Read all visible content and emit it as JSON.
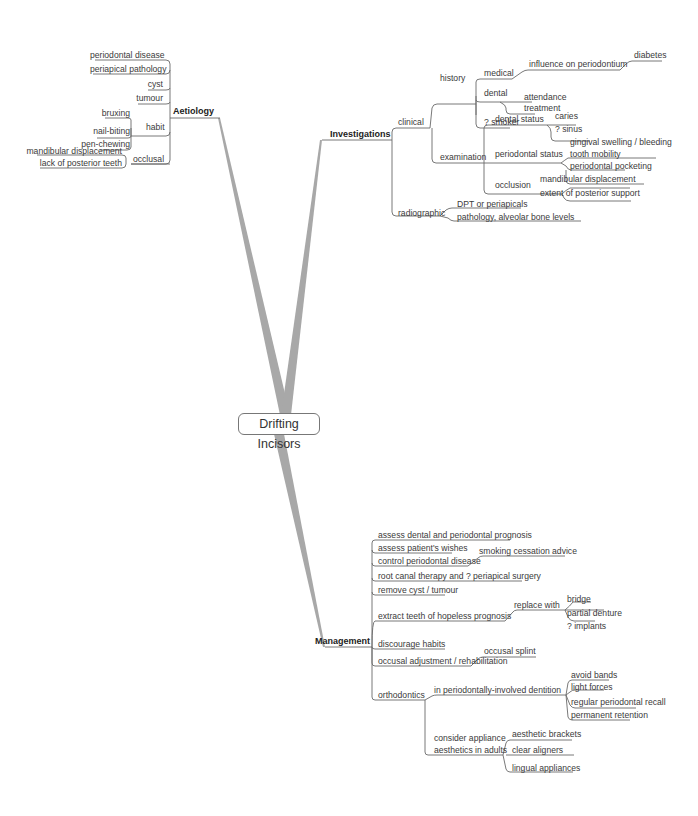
{
  "central": {
    "label": "Drifting Incisors"
  },
  "aetiology": {
    "label": "Aetiology",
    "items": [
      "periodontal disease",
      "periapical pathology",
      "cyst",
      "tumour"
    ],
    "habit": {
      "label": "habit",
      "items": [
        "bruxing",
        "nail-biting",
        "pen-chewing"
      ]
    },
    "occlusal": {
      "label": "occlusal",
      "items": [
        "mandibular displacement",
        "lack of posterior teeth"
      ]
    }
  },
  "investigations": {
    "label": "Investigations",
    "clinical": {
      "label": "clinical",
      "history": {
        "label": "history",
        "medical": {
          "label": "medical",
          "influence": "influence on periodontium",
          "diabetes": "diabetes"
        },
        "dental": {
          "label": "dental",
          "items": [
            "attendance",
            "treatment"
          ]
        },
        "smoker": "? smoker"
      },
      "examination": {
        "label": "examination",
        "dental_status": {
          "label": "dental status",
          "items": [
            "caries",
            "? sinus"
          ]
        },
        "periodontal_status": {
          "label": "periodontal status",
          "items": [
            "gingival swelling / bleeding",
            "tooth mobility",
            "periodontal pocketing"
          ]
        },
        "occlusion": {
          "label": "occlusion",
          "items": [
            "mandibular displacement",
            "extent of posterior support"
          ]
        }
      }
    },
    "radiographic": {
      "label": "radiographic",
      "items": [
        "DPT or periapicals",
        "pathology, alveolar bone levels"
      ]
    }
  },
  "management": {
    "label": "Management",
    "items": {
      "prognosis": "assess dental and periodontal prognosis",
      "wishes": "assess patient's wishes",
      "control": "control periodontal disease",
      "smoking": "smoking cessation advice",
      "root_canal": "root canal therapy and ? periapical surgery",
      "cyst": "remove cyst / tumour",
      "extract": "extract teeth of hopeless prognosis",
      "replace": "replace with",
      "replace_items": [
        "bridge",
        "partial denture",
        "? implants"
      ],
      "habits": "discourage habits",
      "occlusal_adj": "occusal adjustment / rehabilitation",
      "splint": "occusal splint",
      "ortho": "orthodontics",
      "perio_involved": "in periodontally-involved dentition",
      "perio_items": [
        "avoid bands",
        "light forces",
        "regular periodontal recall",
        "permanent retention"
      ],
      "aesthetics_line1": "consider appliance",
      "aesthetics_line2": "aesthetics in adults",
      "aesthetics_items": [
        "aesthetic brackets",
        "clear aligners",
        "lingual appliances"
      ]
    }
  }
}
